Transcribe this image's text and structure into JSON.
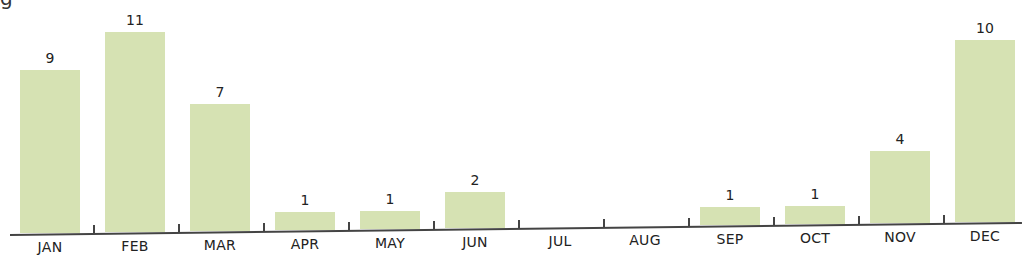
{
  "title_fragment": "g",
  "chart_data": {
    "type": "bar",
    "title": "",
    "xlabel": "",
    "ylabel": "",
    "categories": [
      "JAN",
      "FEB",
      "MAR",
      "APR",
      "MAY",
      "JUN",
      "JUL",
      "AUG",
      "SEP",
      "OCT",
      "NOV",
      "DEC"
    ],
    "values": [
      9,
      11,
      7,
      1,
      1,
      2,
      0,
      0,
      1,
      1,
      4,
      10
    ],
    "value_labels": [
      "9",
      "11",
      "7",
      "1",
      "1",
      "2",
      "",
      "",
      "1",
      "1",
      "4",
      "10"
    ],
    "ylim": [
      0,
      11
    ],
    "grid": false,
    "legend": null,
    "bar_color": "#d6e2b3"
  }
}
